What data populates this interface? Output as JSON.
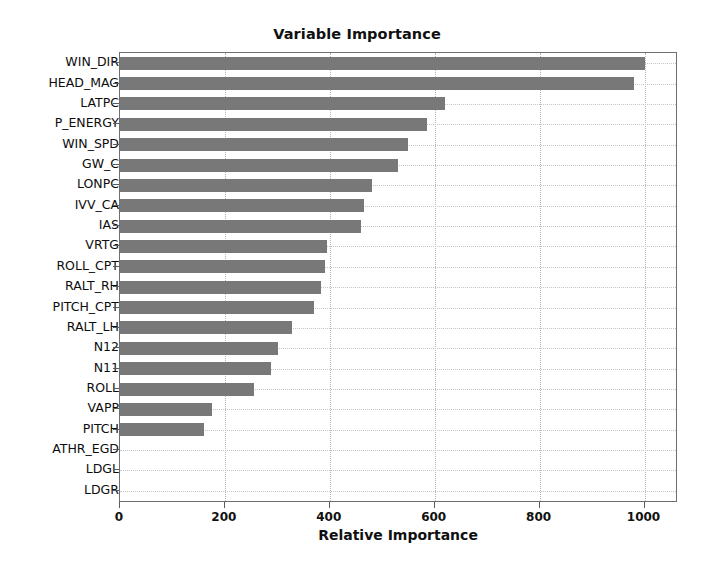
{
  "chart_data": {
    "type": "bar",
    "orientation": "horizontal",
    "title": "Variable Importance",
    "xlabel": "Relative Importance",
    "ylabel": "",
    "xlim": [
      0,
      1060
    ],
    "xticks": [
      0,
      200,
      400,
      600,
      800,
      1000
    ],
    "xtick_labels": [
      "0",
      "200",
      "400",
      "600",
      "800",
      "1000"
    ],
    "grid": true,
    "grid_style": "dotted",
    "legend": null,
    "bar_color": "#787878",
    "categories": [
      "WIN_DIR",
      "HEAD_MAG",
      "LATPC",
      "P_ENERGY",
      "WIN_SPD",
      "GW_C",
      "LONPC",
      "IVV_CA",
      "IAS",
      "VRTG",
      "ROLL_CPT",
      "RALT_RH",
      "PITCH_CPT",
      "RALT_LH",
      "N12",
      "N11",
      "ROLL",
      "VAPP",
      "PITCH",
      "ATHR_EGD",
      "LDGL",
      "LDGR"
    ],
    "values": [
      1000,
      980,
      620,
      585,
      550,
      530,
      480,
      465,
      460,
      395,
      390,
      383,
      370,
      327,
      302,
      288,
      255,
      176,
      160,
      0,
      0,
      0
    ]
  }
}
